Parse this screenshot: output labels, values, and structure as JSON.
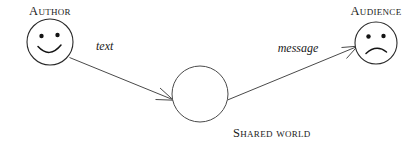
{
  "diagram": {
    "background_color": "#ffffff",
    "stroke_color": "#4a4a4a",
    "text_color": "#1a1a1a",
    "nodes": [
      {
        "id": "author",
        "label": "Author",
        "icon": "smiley-face-happy",
        "expression": "happy",
        "cx": 50,
        "cy": 42,
        "r": 23,
        "label_x": 50,
        "label_y": 15
      },
      {
        "id": "shared-world",
        "label": "Shared world",
        "icon": "empty-circle",
        "expression": "none",
        "cx": 200,
        "cy": 94,
        "r": 28,
        "label_x": 233,
        "label_y": 137
      },
      {
        "id": "audience",
        "label": "Audience",
        "icon": "smiley-face-sad",
        "expression": "sad",
        "cx": 376,
        "cy": 43,
        "r": 21,
        "label_x": 376,
        "label_y": 15
      }
    ],
    "edges": [
      {
        "id": "text-edge",
        "label": "text",
        "from": "author",
        "to": "shared-world",
        "label_x": 96,
        "label_y": 50
      },
      {
        "id": "message-edge",
        "label": "message",
        "from": "shared-world",
        "to": "audience",
        "label_x": 298,
        "label_y": 52
      }
    ]
  }
}
